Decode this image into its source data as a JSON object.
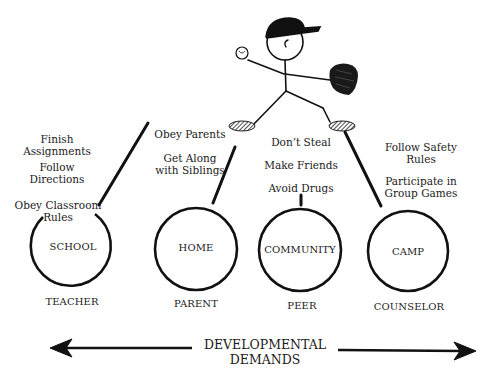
{
  "figure": {
    "type": "developmental-demands-diagram",
    "character": "stick-figure baseball pitcher with cap, ball and glove",
    "settings": [
      {
        "name": "SCHOOL",
        "role": "TEACHER",
        "demands": [
          "Finish Assignments",
          "Follow Directions",
          "Obey Classroom Rules"
        ]
      },
      {
        "name": "HOME",
        "role": "PARENT",
        "demands": [
          "Obey Parents",
          "Get Along with Siblings"
        ]
      },
      {
        "name": "COMMUNITY",
        "role": "PEER",
        "demands": [
          "Don't Steal",
          "Make Friends",
          "Avoid Drugs"
        ]
      },
      {
        "name": "CAMP",
        "role": "COUNSELOR",
        "demands": [
          "Follow Safety Rules",
          "Participate in Group Games"
        ]
      }
    ],
    "axis": {
      "line1": "DEVELOPMENTAL",
      "line2": "DEMANDS",
      "direction": "bidirectional"
    }
  },
  "labels": {
    "school_d1a": "Finish",
    "school_d1b": "Assignments",
    "school_d2a": "Follow",
    "school_d2b": "Directions",
    "school_d3a": "Obey Classroom",
    "school_d3b": "Rules",
    "home_d1": "Obey Parents",
    "home_d2a": "Get Along",
    "home_d2b": "with Siblings",
    "comm_d1": "Don’t Steal",
    "comm_d2": "Make Friends",
    "comm_d3": "Avoid Drugs",
    "camp_d1a": "Follow Safety",
    "camp_d1b": "Rules",
    "camp_d2a": "Participate in",
    "camp_d2b": "Group Games"
  }
}
